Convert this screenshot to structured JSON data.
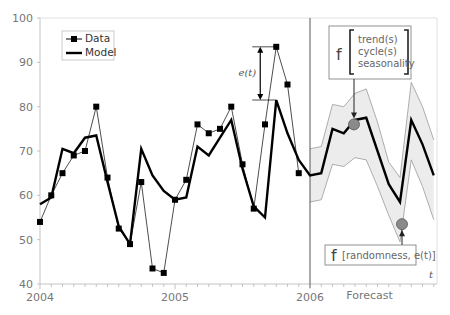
{
  "chart_data": {
    "type": "line",
    "title": "",
    "xlabel": "",
    "ylabel": "",
    "ylim": [
      40,
      100
    ],
    "yticks": [
      "40",
      "50",
      "60",
      "70",
      "80",
      "90",
      "100"
    ],
    "xticks": [
      "2004",
      "2005",
      "2006"
    ],
    "forecast_label": "Forecast",
    "t_label": "t",
    "grid": false,
    "legend_position": "top-left",
    "legend": [
      {
        "name": "Data",
        "style": "thin-line-square-markers"
      },
      {
        "name": "Model",
        "style": "thick-line"
      }
    ],
    "x_months_from_2004": "monthly index, 0 = Jan 2004",
    "series": [
      {
        "name": "Data",
        "x": [
          0,
          1,
          2,
          3,
          4,
          5,
          6,
          7,
          8,
          9,
          10,
          11,
          12,
          13,
          14,
          15,
          16,
          17,
          18,
          19,
          20,
          21,
          22,
          23
        ],
        "values": [
          54,
          60,
          65,
          69,
          70,
          80,
          64,
          52.5,
          49,
          63,
          43.5,
          42.5,
          59,
          63.5,
          76,
          74,
          75,
          80,
          67,
          57,
          76,
          93.5,
          85,
          65
        ]
      },
      {
        "name": "Model",
        "x": [
          0,
          1,
          2,
          3,
          4,
          5,
          6,
          7,
          8,
          9,
          10,
          11,
          12,
          13,
          14,
          15,
          16,
          17,
          18,
          19,
          20,
          21,
          22,
          23,
          24,
          25,
          26,
          27,
          28,
          29,
          30,
          31,
          32,
          33,
          34,
          35
        ],
        "values": [
          58,
          59.5,
          70.5,
          69.5,
          73,
          73.5,
          63,
          53,
          49,
          70.5,
          64.5,
          61,
          59,
          59.5,
          71,
          69,
          73,
          77,
          66,
          57.5,
          55,
          81.5,
          74,
          68,
          64.5,
          65,
          75,
          74,
          77,
          77.5,
          70,
          62.5,
          58.5,
          77,
          71.5,
          64.5
        ]
      },
      {
        "name": "Forecast upper band",
        "x": [
          24,
          25,
          26,
          27,
          28,
          29,
          30,
          31,
          32,
          33,
          34,
          35
        ],
        "values": [
          70.5,
          71,
          80.5,
          80,
          83,
          84,
          76.5,
          67.5,
          64,
          85.5,
          80,
          72.5
        ]
      },
      {
        "name": "Forecast lower band",
        "x": [
          24,
          25,
          26,
          27,
          28,
          29,
          30,
          31,
          32,
          33,
          34,
          35
        ],
        "values": [
          58.5,
          59,
          67,
          66.5,
          68.5,
          68,
          62,
          55.5,
          49.5,
          68,
          62,
          54.5
        ]
      }
    ],
    "annotations": {
      "error_label": "e(t)",
      "error_from": 81.5,
      "error_to": 93.5,
      "error_month": 21,
      "systematic_box": {
        "prefix": "f",
        "lines": [
          "trend(s)",
          "cycle(s)",
          "seasonality"
        ]
      },
      "random_box": {
        "prefix": "f",
        "text": "[randomness, e(t)]"
      },
      "systematic_point": {
        "month": 28,
        "value": 76
      },
      "random_point": {
        "month": 32,
        "value": 53.5
      }
    },
    "colors": {
      "line": "#000000",
      "band_fill": "#ececec",
      "band_stroke": "#9a9a9a",
      "axis": "#b5b5b5",
      "point_fill": "#8a8a8a"
    }
  }
}
